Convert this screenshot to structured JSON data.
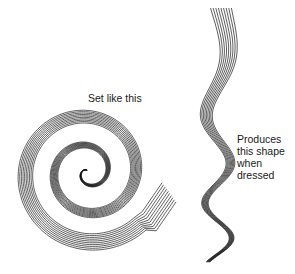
{
  "figure": {
    "left_illustration": {
      "description": "hair strand wound into a flat pin-curl spiral",
      "label": "Set like this"
    },
    "right_illustration": {
      "description": "wavy hair strand after combing out",
      "label_lines": [
        "Produces",
        "this shape",
        "when",
        "dressed"
      ]
    },
    "colors": {
      "background": "#ffffff",
      "ink": "#1a1a1a"
    }
  }
}
